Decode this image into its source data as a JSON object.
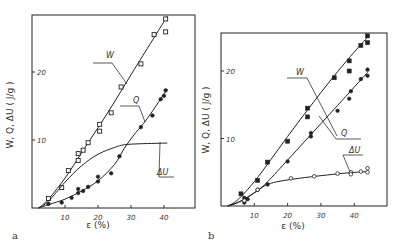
{
  "chart_data": [
    {
      "type": "scatter",
      "panel_label": "a",
      "xlabel": "ε (%)",
      "ylabel": "W, Q, ΔU ( J/g )",
      "xlim": [
        0,
        50
      ],
      "ylim": [
        0,
        28
      ],
      "xticks": [
        10,
        20,
        30,
        40
      ],
      "yticks": [
        10,
        20
      ],
      "series": [
        {
          "name": "W",
          "marker": "square",
          "x": [
            5,
            9,
            11,
            14,
            14,
            15.5,
            17,
            20.5,
            20.5,
            24,
            27,
            33,
            37,
            40.5,
            40.5
          ],
          "y": [
            1.4,
            3.0,
            5.5,
            7.0,
            8.0,
            8.5,
            9.6,
            11.3,
            12.3,
            14.0,
            17.8,
            21.2,
            25.5,
            25.9,
            27.8
          ],
          "curve": [
            [
              2,
              0
            ],
            [
              5,
              1.3
            ],
            [
              10,
              4.4
            ],
            [
              15,
              8.1
            ],
            [
              20,
              11.8
            ],
            [
              25,
              15.6
            ],
            [
              30,
              19.6
            ],
            [
              35,
              23.5
            ],
            [
              41,
              28.2
            ]
          ]
        },
        {
          "name": "Q",
          "marker": "filled",
          "x": [
            5,
            9,
            12,
            14,
            14,
            15.5,
            17,
            20,
            20,
            24,
            26.5,
            33,
            36.5,
            39,
            40,
            40.5
          ],
          "y": [
            0.6,
            0.8,
            1.5,
            2.2,
            2.8,
            2.5,
            3.1,
            3.9,
            4.6,
            5.1,
            7.6,
            11.9,
            13.6,
            16.0,
            16.5,
            17.3
          ],
          "curve": [
            [
              2,
              0
            ],
            [
              5,
              0.5
            ],
            [
              10,
              1.3
            ],
            [
              15,
              2.5
            ],
            [
              20,
              4.0
            ],
            [
              25,
              6.4
            ],
            [
              28,
              8.8
            ],
            [
              31,
              10.8
            ],
            [
              35,
              13.2
            ],
            [
              41,
              17.5
            ]
          ]
        },
        {
          "name": "ΔU",
          "marker": "none",
          "curve": [
            [
              2,
              0
            ],
            [
              5,
              1.0
            ],
            [
              10,
              3.8
            ],
            [
              15,
              6.2
            ],
            [
              20,
              7.9
            ],
            [
              25,
              8.9
            ],
            [
              28,
              9.3
            ],
            [
              33,
              9.45
            ],
            [
              41,
              9.55
            ]
          ]
        }
      ]
    },
    {
      "type": "scatter",
      "panel_label": "b",
      "xlabel": "ε  (%)",
      "ylabel": "W, Q, ΔU ( J/g )",
      "xlim": [
        0,
        50
      ],
      "ylim": [
        0,
        26
      ],
      "xticks": [
        10,
        20,
        30,
        40
      ],
      "yticks": [
        10,
        20
      ],
      "series": [
        {
          "name": "W",
          "marker": "filled-square",
          "x": [
            6,
            11,
            14,
            20,
            26,
            26,
            34,
            38.5,
            38.5,
            42,
            44,
            44
          ],
          "y": [
            1.8,
            3.8,
            6.5,
            9.6,
            13.2,
            14.5,
            19.0,
            20.0,
            21.5,
            23.8,
            24.2,
            25.2
          ],
          "curve": [
            [
              2,
              0
            ],
            [
              5,
              0.9
            ],
            [
              10,
              3.6
            ],
            [
              15,
              6.9
            ],
            [
              20,
              10.3
            ],
            [
              25,
              13.6
            ],
            [
              30,
              16.8
            ],
            [
              35,
              19.9
            ],
            [
              40,
              22.8
            ],
            [
              44,
              25.0
            ]
          ]
        },
        {
          "name": "Q",
          "marker": "filled",
          "x": [
            7,
            7,
            8,
            11,
            14,
            20,
            27,
            27,
            35,
            38.5,
            39,
            42,
            44,
            44
          ],
          "y": [
            0.5,
            1.2,
            1.0,
            2.4,
            3.2,
            6.6,
            10.3,
            10.8,
            14.1,
            15.9,
            17.0,
            18.8,
            19.3,
            20.2
          ],
          "curve": [
            [
              2,
              0
            ],
            [
              5,
              0.5
            ],
            [
              8,
              1.3
            ],
            [
              11,
              2.3
            ],
            [
              14,
              3.6
            ],
            [
              20,
              6.8
            ],
            [
              25,
              9.5
            ],
            [
              30,
              12.2
            ],
            [
              35,
              14.9
            ],
            [
              40,
              17.6
            ],
            [
              44,
              19.8
            ]
          ]
        },
        {
          "name": "ΔU",
          "marker": "open-circle",
          "x": [
            7,
            11,
            21,
            28,
            35,
            39,
            39,
            42,
            44,
            44
          ],
          "y": [
            0.8,
            2.4,
            4.1,
            4.4,
            4.8,
            5.0,
            4.7,
            5.1,
            5.0,
            5.6
          ],
          "curve": [
            [
              2,
              0
            ],
            [
              5,
              0.5
            ],
            [
              8,
              1.3
            ],
            [
              11,
              2.3
            ],
            [
              14,
              3.2
            ],
            [
              18,
              3.7
            ],
            [
              25,
              4.2
            ],
            [
              32,
              4.6
            ],
            [
              38,
              4.9
            ],
            [
              44,
              5.1
            ]
          ]
        }
      ]
    }
  ]
}
